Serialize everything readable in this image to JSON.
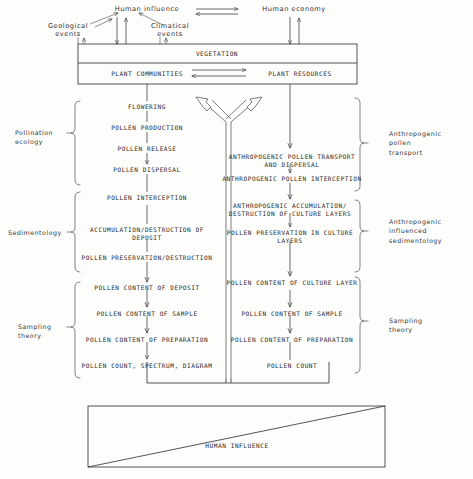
{
  "diagram": {
    "top": {
      "human_influence": "Human influence",
      "human_economy": "Human economy",
      "geological_events": "Geological\nevents",
      "climatical_events": "Climatical\nevents"
    },
    "vegetation_box": {
      "header": "VEGETATION",
      "left_cell": "PLANT COMMUNITIES",
      "right_cell": "PLANT RESOURCES"
    },
    "left_column": [
      "FLOWERING",
      "POLLEN PRODUCTION",
      "POLLEN RELEASE",
      "POLLEN DISPERSAL",
      "POLLEN INTERCEPTION",
      "ACCUMULATION/DESTRUCTION OF\nDEPOSIT",
      "POLLEN PRESERVATION/DESTRUCTION",
      "POLLEN CONTENT OF DEPOSIT",
      "POLLEN CONTENT OF SAMPLE",
      "POLLEN CONTENT OF PREPARATION",
      "POLLEN COUNT, SPECTRUM, DIAGRAM"
    ],
    "right_column": [
      "ANTHROPOGENIC POLLEN TRANSPORT\nAND DISPERSAL",
      "ANTHROPOGENIC POLLEN INTERCEPTION",
      "ANTHROPOGENIC ACCUMULATION/\nDESTRUCTION OF CULTURE LAYERS",
      "POLLEN PRESERVATION IN CULTURE\nLAYERS",
      "POLLEN CONTENT OF CULTURE LAYER",
      "POLLEN CONTENT OF SAMPLE",
      "POLLEN CONTENT OF PREPARATION",
      "POLLEN COUNT"
    ],
    "left_braces": [
      "Pollination\necology",
      "Sedimentology",
      "Sampling\ntheory"
    ],
    "right_braces": [
      "Anthropogenic\npollen\ntransport",
      "Anthropogenic\ninfluenced\nsedimentology",
      "Sampling\ntheory"
    ],
    "bottom_box": {
      "label": "HUMAN INFLUENCE"
    },
    "colors": {
      "ink": "#35353a",
      "background": "#fdfdfc"
    }
  }
}
